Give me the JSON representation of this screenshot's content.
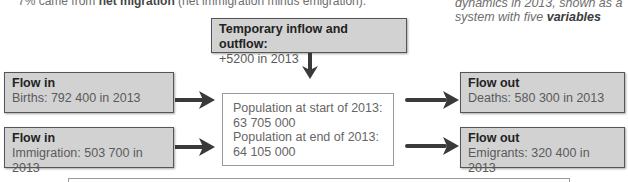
{
  "caption_top": {
    "prefix": "7% came from ",
    "bold": "net migration",
    "suffix": " (net immigration minus emigration)."
  },
  "caption_right": {
    "line1": "dynamics in 2013, shown as a",
    "line2_prefix": "system with five ",
    "line2_bold": "variables"
  },
  "temporary": {
    "title": "Temporary inflow and outflow:",
    "value": "+5200 in 2013"
  },
  "population": {
    "start_label": "Population at start of 2013:",
    "start_value": "63 705 000",
    "end_label": "Population at end of 2013:",
    "end_value": "64 105 000"
  },
  "flows_in": [
    {
      "title": "Flow in",
      "value": "Births: 792 400 in 2013"
    },
    {
      "title": "Flow in",
      "value": "Immigration: 503 700 in 2013"
    }
  ],
  "flows_out": [
    {
      "title": "Flow out",
      "value": "Deaths: 580 300 in 2013"
    },
    {
      "title": "Flow out",
      "value": "Emigrants: 320 400 in 2013"
    }
  ],
  "colors": {
    "box_fill": "#d2d2d2",
    "box_border": "#555555",
    "arrow": "#3a3a3a"
  }
}
